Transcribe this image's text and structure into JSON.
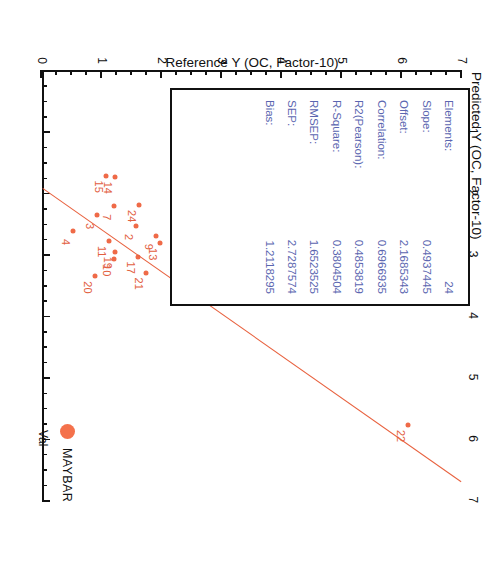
{
  "chart_data": {
    "type": "scatter",
    "xlabel": "Predicted Y (OC, Factor-10)",
    "ylabel": "Reference Y (OC, Factor-10)",
    "xlim": [
      0,
      7
    ],
    "ylim": [
      0,
      7
    ],
    "xticks": [
      0,
      1,
      2,
      3,
      4,
      5,
      6,
      7
    ],
    "yticks": [
      0,
      1,
      2,
      3,
      4,
      5,
      6,
      7
    ],
    "grid": false,
    "legend_position": "bottom-right",
    "points": [
      {
        "label": "4",
        "x": 2.62,
        "y": 0.52
      },
      {
        "label": "20",
        "x": 3.36,
        "y": 0.88
      },
      {
        "label": "3",
        "x": 2.36,
        "y": 0.92
      },
      {
        "label": "15",
        "x": 1.72,
        "y": 1.06
      },
      {
        "label": "14",
        "x": 1.74,
        "y": 1.22
      },
      {
        "label": "7",
        "x": 2.22,
        "y": 1.2
      },
      {
        "label": "11",
        "x": 2.78,
        "y": 1.12
      },
      {
        "label": "19",
        "x": 2.96,
        "y": 1.22
      },
      {
        "label": "10",
        "x": 3.08,
        "y": 1.2
      },
      {
        "label": "2",
        "x": 2.54,
        "y": 1.56
      },
      {
        "label": "24",
        "x": 2.2,
        "y": 1.62
      },
      {
        "label": "17",
        "x": 3.04,
        "y": 1.6
      },
      {
        "label": "21",
        "x": 3.3,
        "y": 1.74
      },
      {
        "label": "9",
        "x": 2.7,
        "y": 1.9
      },
      {
        "label": "13",
        "x": 2.82,
        "y": 1.96
      },
      {
        "label": "6",
        "x": 2.36,
        "y": 4.28
      },
      {
        "label": "5",
        "x": 3.36,
        "y": 6.7
      },
      {
        "label": "22",
        "x": 5.78,
        "y": 6.1
      }
    ],
    "regression_line": {
      "x1": 1.92,
      "y1": 0.02,
      "x2": 6.7,
      "y2": 7.0,
      "color": "#e8613e"
    },
    "marker_color": "#ef6a47",
    "series_name": "MAYBAR",
    "series_type": "Val"
  },
  "stats": {
    "color": "#5b66b0",
    "rows": [
      {
        "key": "Elements:",
        "value": "24"
      },
      {
        "key": "Slope:",
        "value": "0.4937445"
      },
      {
        "key": "Offset:",
        "value": "2.1685343"
      },
      {
        "key": "Correlation:",
        "value": "0.6966935"
      },
      {
        "key": "R2(Pearson):",
        "value": "0.4853819"
      },
      {
        "key": "R-Square:",
        "value": "0.3804504"
      },
      {
        "key": "RMSEP:",
        "value": "1.6523525"
      },
      {
        "key": "SEP:",
        "value": "2.7287574"
      },
      {
        "key": "Bias:",
        "value": "1.2118295"
      }
    ]
  },
  "legend": {
    "sample_name": "MAYBAR",
    "val_label": "Val"
  }
}
